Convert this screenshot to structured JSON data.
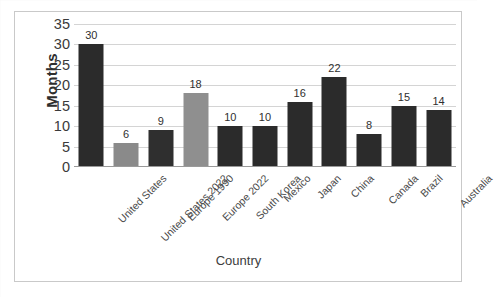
{
  "chart_data": {
    "type": "bar",
    "title": "",
    "xlabel": "Country",
    "ylabel": "Months",
    "ylim": [
      0,
      35
    ],
    "ytick_step": 5,
    "yticks": [
      35,
      30,
      25,
      20,
      15,
      10,
      5,
      0
    ],
    "grid": true,
    "legend": "none",
    "categories": [
      "United States",
      "United States  2022",
      "Europe 1990",
      "Europe 2022",
      "South Korea",
      "Mexico",
      "Japan",
      "China",
      "Canada",
      "Brazil",
      "Australia"
    ],
    "values": [
      30,
      6,
      9,
      18,
      10,
      10,
      16,
      22,
      8,
      15,
      14
    ],
    "data_labels": [
      "30",
      "6",
      "9",
      "18",
      "10",
      "10",
      "16",
      "22",
      "8",
      "15",
      "14"
    ],
    "bar_colors": [
      "#2b2b2b",
      "#8a8a8a",
      "#2f2f2f",
      "#8f8f8f",
      "#2b2b2b",
      "#2b2b2b",
      "#2b2b2b",
      "#2b2b2b",
      "#2b2b2b",
      "#2b2b2b",
      "#2b2b2b"
    ]
  },
  "colors": {
    "dark_bar": "#2b2b2b",
    "gray_bar": "#8a8a8a",
    "gridline": "#d4d4d4",
    "axis": "#9a9a9a",
    "frame_border": "#c9c9c9",
    "background": "#ffffff",
    "tick_text": "#3a3a3a"
  }
}
